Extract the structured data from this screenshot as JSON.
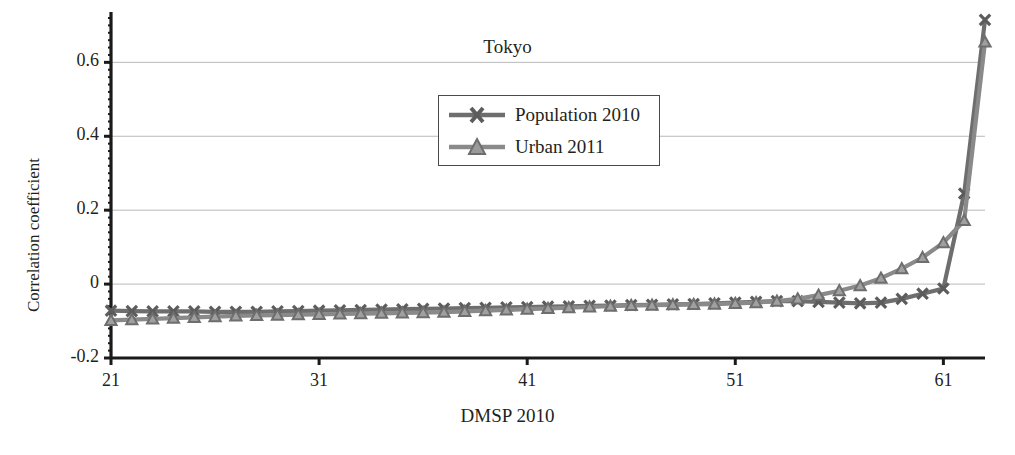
{
  "chart_data": {
    "type": "line",
    "title": "Tokyo",
    "xlabel": "DMSP 2010",
    "ylabel": "Correlation coefficient",
    "xlim": [
      21,
      63
    ],
    "ylim": [
      -0.2,
      0.72
    ],
    "xticks": [
      21,
      31,
      41,
      51,
      61
    ],
    "xtick_labels": [
      "21",
      "31",
      "41",
      "51",
      "61"
    ],
    "yticks": [
      -0.2,
      0,
      0.2,
      0.4,
      0.6
    ],
    "ytick_labels": [
      "-0.2",
      "0",
      "0.2",
      "0.4",
      "0.6"
    ],
    "grid": "horizontal",
    "legend_position": "upper-center",
    "x": [
      21,
      22,
      23,
      24,
      25,
      26,
      27,
      28,
      29,
      30,
      31,
      32,
      33,
      34,
      35,
      36,
      37,
      38,
      39,
      40,
      41,
      42,
      43,
      44,
      45,
      46,
      47,
      48,
      49,
      50,
      51,
      52,
      53,
      54,
      55,
      56,
      57,
      58,
      59,
      60,
      61,
      62,
      63
    ],
    "series": [
      {
        "name": "Population 2010",
        "marker": "x",
        "color": "#6e6e6e",
        "values": [
          -0.072,
          -0.073,
          -0.074,
          -0.074,
          -0.074,
          -0.075,
          -0.075,
          -0.075,
          -0.074,
          -0.073,
          -0.072,
          -0.071,
          -0.07,
          -0.069,
          -0.068,
          -0.067,
          -0.066,
          -0.065,
          -0.064,
          -0.063,
          -0.062,
          -0.061,
          -0.06,
          -0.059,
          -0.058,
          -0.057,
          -0.056,
          -0.055,
          -0.054,
          -0.052,
          -0.05,
          -0.048,
          -0.046,
          -0.046,
          -0.048,
          -0.05,
          -0.052,
          -0.05,
          -0.04,
          -0.026,
          -0.012,
          0.245,
          0.715
        ]
      },
      {
        "name": "Urban 2011",
        "marker": "triangle",
        "color": "#8a8a8a",
        "values": [
          -0.098,
          -0.096,
          -0.094,
          -0.092,
          -0.09,
          -0.088,
          -0.086,
          -0.085,
          -0.084,
          -0.083,
          -0.082,
          -0.081,
          -0.08,
          -0.079,
          -0.078,
          -0.077,
          -0.076,
          -0.074,
          -0.072,
          -0.07,
          -0.068,
          -0.066,
          -0.064,
          -0.062,
          -0.06,
          -0.058,
          -0.057,
          -0.056,
          -0.055,
          -0.054,
          -0.052,
          -0.05,
          -0.046,
          -0.04,
          -0.03,
          -0.018,
          -0.004,
          0.016,
          0.042,
          0.072,
          0.112,
          0.172,
          0.655
        ]
      }
    ]
  },
  "legend": {
    "items": [
      {
        "label": "Population 2010"
      },
      {
        "label": "Urban 2011"
      }
    ]
  },
  "style": {
    "axis_color": "#1a1a1a",
    "grid_color": "#b9b9b9",
    "background": "#ffffff"
  }
}
